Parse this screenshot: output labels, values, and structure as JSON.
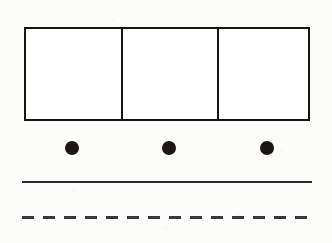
{
  "figure": {
    "canvas": {
      "width": 332,
      "height": 243,
      "background_color": "#fcfcfb"
    },
    "ink_color": "#1b1713",
    "rule_color": "#2e2b2e",
    "bar_model": {
      "name": "three-part bar model",
      "x": 24,
      "y": 27,
      "width": 286,
      "height": 94,
      "border_width": 2,
      "divider_width": 2,
      "border_color": "#17130f",
      "fill_color": "#ffffff",
      "cell_count": 3,
      "cells": [
        {
          "label": "",
          "width": 96
        },
        {
          "label": "",
          "width": 98
        },
        {
          "label": "",
          "width": 92
        }
      ]
    },
    "counters": {
      "name": "counter dots",
      "count": 3,
      "diameter": 14,
      "color": "#1b1713",
      "center_y": 148,
      "items": [
        {
          "label": "",
          "cx": 72
        },
        {
          "label": "",
          "cx": 169
        },
        {
          "label": "",
          "cx": 267
        }
      ]
    },
    "rules": [
      {
        "name": "solid-rule",
        "style": "solid",
        "x": 22,
        "y": 181,
        "length": 290,
        "thickness": 2,
        "color": "#2e2b2e"
      },
      {
        "name": "dashed-rule",
        "style": "dashed",
        "x": 22,
        "y": 216,
        "length": 290,
        "thickness": 3,
        "color": "#3a3a3c",
        "dash_length": 12,
        "gap_length": 9
      }
    ]
  }
}
